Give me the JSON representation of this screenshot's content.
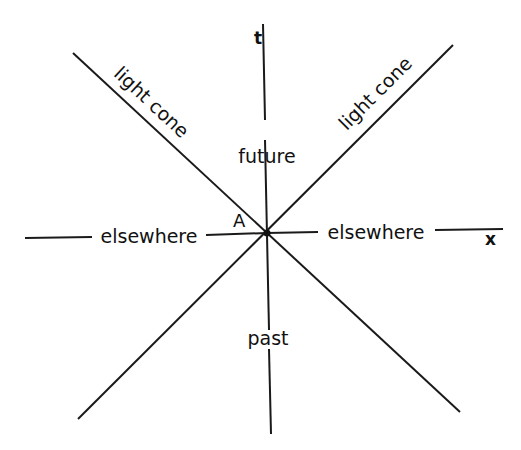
{
  "diagram": {
    "axes": {
      "t_label": "t",
      "x_label": "x"
    },
    "event_label": "A",
    "regions": {
      "future": "future",
      "past": "past",
      "elsewhere_left": "elsewhere",
      "elsewhere_right": "elsewhere"
    },
    "light_cone_labels": {
      "left": "light cone",
      "right": "light cone"
    },
    "colors": {
      "line": "#1a1a1a",
      "background": "#ffffff"
    }
  }
}
